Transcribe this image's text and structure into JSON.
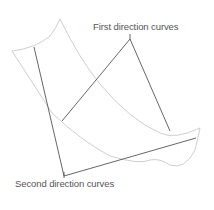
{
  "diagram": {
    "labels": {
      "first": "First direction curves",
      "second": "Second direction curves"
    },
    "colors": {
      "surface_edge": "#c8c8c8",
      "direction_curve": "#555555",
      "label_text": "#555555",
      "background": "#ffffff"
    }
  }
}
